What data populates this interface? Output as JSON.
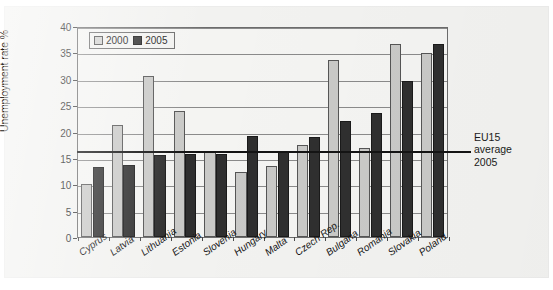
{
  "chart_data": {
    "type": "bar",
    "title": "",
    "xlabel": "",
    "ylabel": "Unemployment rate %",
    "ylim": [
      0,
      40
    ],
    "yticks": [
      0,
      5,
      10,
      15,
      20,
      25,
      30,
      35,
      40
    ],
    "grid": true,
    "legend_position": "top-left",
    "categories": [
      "Cyprus",
      "Latvia",
      "Lithuania",
      "Estonia",
      "Slovenia",
      "Hungary",
      "Malta",
      "Czech Rep.",
      "Bulgaria",
      "Romania",
      "Slovakia",
      "Poland"
    ],
    "series": [
      {
        "name": "2000",
        "color": "#c9c9c7",
        "values": [
          10.0,
          21.3,
          30.5,
          23.9,
          16.2,
          12.3,
          13.4,
          17.5,
          33.5,
          16.8,
          36.6,
          34.8
        ]
      },
      {
        "name": "2005",
        "color": "#2f2f2f",
        "values": [
          13.2,
          13.6,
          15.6,
          15.8,
          15.7,
          19.2,
          16.2,
          18.9,
          22.0,
          23.5,
          29.6,
          36.5
        ]
      }
    ],
    "annotations": [
      {
        "name": "eu15-average-2005",
        "type": "hline",
        "value": 16.5,
        "label_lines": [
          "EU15",
          "average",
          "2005"
        ]
      }
    ]
  },
  "legend": {
    "items": [
      {
        "label": "2000",
        "swatch": "light-swatch-icon"
      },
      {
        "label": "2005",
        "swatch": "dark-swatch-icon"
      }
    ]
  },
  "annotation_label": {
    "line1": "EU15",
    "line2": "average",
    "line3": "2005"
  }
}
